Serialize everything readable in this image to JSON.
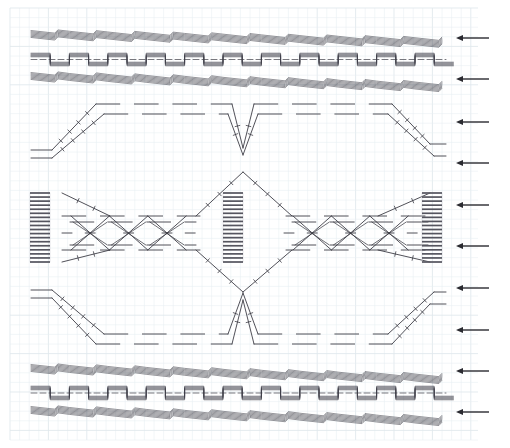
{
  "canvas": {
    "width": 510,
    "height": 448,
    "background": "#ffffff"
  },
  "grid": {
    "minor_color": "#e8eef2",
    "major_color": "#dfe7ec",
    "minor_step": 9.6,
    "major_step": 38.4,
    "x_start": 10,
    "x_end": 478,
    "y_start": 8,
    "y_end": 440,
    "visible": true
  },
  "plot": {
    "trace_color": "#3d3d46",
    "trace_width": 0.9,
    "tick_color": "#3d3d46",
    "hatch_color": "#55555f",
    "arrow_color": "#2a2a30",
    "x_left": 31,
    "x_right": 446,
    "period": 38.4
  },
  "chart_data": {
    "type": "line",
    "title": "",
    "xlabel": "",
    "ylabel": "",
    "xlim": [
      31,
      446
    ],
    "ylim": [
      0,
      448
    ],
    "grid": true,
    "legend": null,
    "annotations": {
      "arrow_count": 10,
      "arrow_direction": "left",
      "arrow_x_tail": 489,
      "arrow_x_head": 456,
      "arrow_y_positions": [
        38,
        79,
        122,
        163,
        205,
        246,
        288,
        330,
        371,
        412
      ]
    },
    "hatch_bars": [
      {
        "x": 40,
        "y_top": 193,
        "y_bottom": 262,
        "stripes": 17
      },
      {
        "x": 233,
        "y_top": 193,
        "y_bottom": 262,
        "stripes": 17
      },
      {
        "x": 432,
        "y_top": 193,
        "y_bottom": 262,
        "stripes": 17
      }
    ],
    "series": [
      {
        "name": "top-ripple-upper",
        "baseline_y": 36,
        "kind": "ripple-down",
        "values": [
          36,
          36,
          37,
          38,
          39,
          40,
          40,
          41,
          42,
          43,
          43
        ]
      },
      {
        "name": "top-square-a",
        "baseline_y": 57,
        "kind": "square",
        "values": [
          57,
          57,
          57,
          57,
          57,
          57,
          57,
          57,
          57,
          57,
          57
        ]
      },
      {
        "name": "top-square-b",
        "baseline_y": 62,
        "kind": "square",
        "values": [
          62,
          62,
          62,
          62,
          62,
          62,
          62,
          62,
          62,
          62,
          62
        ]
      },
      {
        "name": "top-ripple-lower",
        "baseline_y": 78,
        "kind": "ripple-down",
        "values": [
          78,
          79,
          80,
          81,
          82,
          83,
          84,
          85,
          86,
          87,
          88
        ]
      },
      {
        "name": "trapezoid-outer-1",
        "kind": "trapezoid",
        "low_y": 150,
        "high_y": 104,
        "rise_x": [
          47,
          95
        ],
        "fall_x": [
          240,
          288
        ],
        "rise2_x": [
          288,
          336
        ],
        "fall2_x": [
          430,
          446
        ]
      },
      {
        "name": "trapezoid-inner-1",
        "kind": "trapezoid",
        "low_y": 158,
        "high_y": 114,
        "rise_x": [
          47,
          103
        ],
        "fall_x": [
          232,
          288
        ],
        "rise2_x": [
          288,
          344
        ],
        "fall2_x": [
          422,
          446
        ]
      },
      {
        "name": "x-envelope-upper",
        "kind": "diamond-envelope",
        "top_y": 215,
        "bottom_y": 245
      },
      {
        "name": "x-envelope-lower",
        "kind": "diamond-envelope",
        "top_y": 222,
        "bottom_y": 252
      },
      {
        "name": "trapezoid-outer-2",
        "kind": "trapezoid",
        "low_y": 298,
        "high_y": 344,
        "rise_x": [
          47,
          95
        ],
        "fall_x": [
          240,
          288
        ]
      },
      {
        "name": "trapezoid-inner-2",
        "kind": "trapezoid",
        "low_y": 290,
        "high_y": 334,
        "rise_x": [
          47,
          103
        ],
        "fall_x": [
          232,
          288
        ]
      },
      {
        "name": "bottom-ripple-upper",
        "baseline_y": 370,
        "kind": "ripple-up",
        "values": [
          370,
          371,
          372,
          373,
          374,
          375,
          376,
          377,
          378,
          379,
          380
        ]
      },
      {
        "name": "bottom-square-a",
        "baseline_y": 391,
        "kind": "square",
        "values": [
          391,
          391,
          391,
          391,
          391,
          391,
          391,
          391,
          391,
          391,
          391
        ]
      },
      {
        "name": "bottom-square-b",
        "baseline_y": 396,
        "kind": "square",
        "values": [
          396,
          396,
          396,
          396,
          396,
          396,
          396,
          396,
          396,
          396,
          396
        ]
      },
      {
        "name": "bottom-ripple-lower",
        "baseline_y": 412,
        "kind": "ripple-up",
        "values": [
          412,
          413,
          414,
          415,
          416,
          417,
          418,
          419,
          420,
          421,
          422
        ]
      }
    ]
  }
}
